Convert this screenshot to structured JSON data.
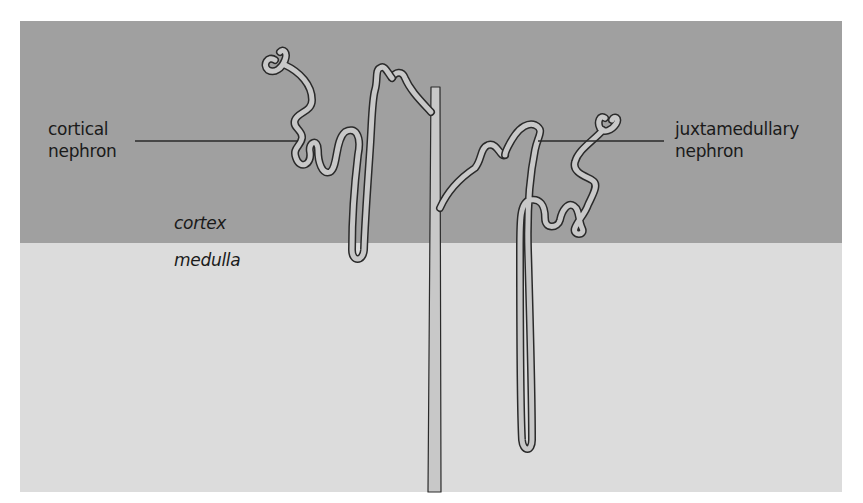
{
  "diagram": {
    "type": "anatomical-schematic",
    "regions": [
      {
        "name": "cortex",
        "label": "cortex",
        "color": "#a0a0a0"
      },
      {
        "name": "medulla",
        "label": "medulla",
        "color": "#dcdcdc"
      }
    ],
    "labels": {
      "cortical": {
        "line1": "cortical",
        "line2": "nephron"
      },
      "juxtamedullary": {
        "line1": "juxtamedullary",
        "line2": "nephron"
      }
    },
    "colors": {
      "tubule_fill": "#c8c8c8",
      "outline": "#2a2a2a",
      "leader_line": "#2a2a2a",
      "background": "#ffffff"
    }
  }
}
